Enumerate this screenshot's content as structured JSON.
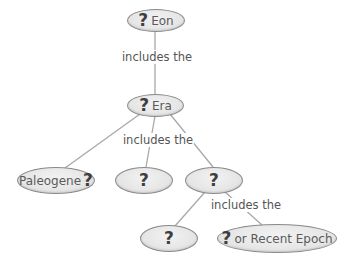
{
  "diagram": {
    "type": "concept-map",
    "nodes": [
      {
        "id": "eon",
        "prefix": "?",
        "text": "Eon"
      },
      {
        "id": "era",
        "prefix": "?",
        "text": "Era"
      },
      {
        "id": "paleogene",
        "text": "Paleogene",
        "suffix": "?"
      },
      {
        "id": "period-middle",
        "prefix": "?",
        "text": ""
      },
      {
        "id": "period-right",
        "prefix": "?",
        "text": ""
      },
      {
        "id": "epoch-left",
        "prefix": "?",
        "text": ""
      },
      {
        "id": "epoch-recent",
        "prefix": "?",
        "text": "or Recent Epoch"
      }
    ],
    "links": [
      {
        "from": "eon",
        "to": "era",
        "label": "includes the"
      },
      {
        "from": "era",
        "to": "paleogene",
        "label": "includes the"
      },
      {
        "from": "era",
        "to": "period-middle",
        "label": "includes the"
      },
      {
        "from": "era",
        "to": "period-right",
        "label": "includes the"
      },
      {
        "from": "period-right",
        "to": "epoch-left",
        "label": "includes the"
      },
      {
        "from": "period-right",
        "to": "epoch-recent",
        "label": "includes the"
      }
    ],
    "link_labels": [
      "includes the",
      "includes the",
      "includes the"
    ],
    "colors": {
      "node_fill": "#e4e4e4",
      "node_border": "#8a8a8a",
      "line": "#a8a8a8",
      "text": "#5a5a5a"
    }
  }
}
